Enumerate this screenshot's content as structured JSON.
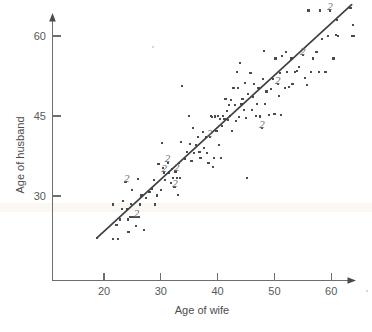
{
  "chart_data": {
    "type": "scatter",
    "title": "",
    "xlabel": "Age of wife",
    "ylabel": "Age of husband",
    "xlim": [
      14,
      66.5
    ],
    "ylim": [
      19.5,
      66.5
    ],
    "xticks": [
      20,
      30,
      40,
      50,
      60
    ],
    "yticks": [
      30,
      45,
      60
    ],
    "xtick_labels": [
      "20",
      "30",
      "40",
      "50",
      "60"
    ],
    "ytick_labels": [
      "30",
      "45",
      "60"
    ],
    "grid": false,
    "legend": null,
    "annotations": [
      {
        "text": "2",
        "x": 24.0,
        "y": 32.6
      },
      {
        "text": "2",
        "x": 25.7,
        "y": 26.0
      },
      {
        "text": "2",
        "x": 31.2,
        "y": 36.4
      },
      {
        "text": "2",
        "x": 30.6,
        "y": 34.5
      },
      {
        "text": "2",
        "x": 32.8,
        "y": 34.6
      },
      {
        "text": "2",
        "x": 32.5,
        "y": 31.6
      },
      {
        "text": "2",
        "x": 38.6,
        "y": 41.1
      },
      {
        "text": "2",
        "x": 47.8,
        "y": 42.7
      },
      {
        "text": "2",
        "x": 50.6,
        "y": 51.0
      },
      {
        "text": "2",
        "x": 55.0,
        "y": 56.5
      },
      {
        "text": "2",
        "x": 59.8,
        "y": 64.8
      }
    ],
    "fit_line": {
      "x": [
        18.8,
        63.6
      ],
      "y": [
        22.2,
        65.9
      ]
    },
    "points": [
      [
        18.8,
        22.2
      ],
      [
        21.6,
        22.0
      ],
      [
        22.4,
        22.0
      ],
      [
        21.6,
        28.4
      ],
      [
        22.2,
        24.5
      ],
      [
        22.8,
        25.6
      ],
      [
        23.2,
        27.5
      ],
      [
        23.4,
        29.0
      ],
      [
        23.8,
        32.6
      ],
      [
        24.0,
        27.5
      ],
      [
        24.2,
        25.6
      ],
      [
        24.3,
        23.2
      ],
      [
        24.6,
        26.0
      ],
      [
        24.8,
        28.5
      ],
      [
        24.9,
        31.2
      ],
      [
        25.0,
        26.0
      ],
      [
        25.4,
        26.1
      ],
      [
        25.6,
        24.4
      ],
      [
        25.8,
        26.1
      ],
      [
        26.0,
        33.2
      ],
      [
        26.2,
        26.1
      ],
      [
        26.4,
        28.4
      ],
      [
        26.6,
        30.1
      ],
      [
        27.0,
        23.6
      ],
      [
        27.4,
        29.6
      ],
      [
        28.0,
        30.8
      ],
      [
        28.4,
        31.4
      ],
      [
        28.8,
        33.0
      ],
      [
        29.0,
        28.4
      ],
      [
        29.4,
        30.1
      ],
      [
        29.6,
        36.0
      ],
      [
        30.0,
        31.1
      ],
      [
        30.2,
        40.0
      ],
      [
        30.4,
        35.2
      ],
      [
        30.6,
        34.4
      ],
      [
        30.8,
        33.0
      ],
      [
        31.2,
        36.2
      ],
      [
        31.5,
        34.4
      ],
      [
        31.8,
        32.4
      ],
      [
        32.0,
        35.1
      ],
      [
        32.2,
        33.4
      ],
      [
        32.4,
        31.7
      ],
      [
        32.6,
        34.6
      ],
      [
        32.8,
        33.4
      ],
      [
        33.0,
        30.2
      ],
      [
        33.2,
        36.2
      ],
      [
        33.4,
        33.4
      ],
      [
        33.6,
        40.2
      ],
      [
        33.8,
        50.6
      ],
      [
        34.2,
        37.0
      ],
      [
        34.6,
        38.2
      ],
      [
        35.0,
        45.0
      ],
      [
        35.2,
        39.8
      ],
      [
        35.4,
        36.6
      ],
      [
        35.6,
        42.8
      ],
      [
        35.8,
        38.0
      ],
      [
        36.2,
        39.6
      ],
      [
        36.6,
        41.0
      ],
      [
        36.8,
        38.2
      ],
      [
        37.0,
        37.2
      ],
      [
        37.4,
        42.0
      ],
      [
        37.6,
        39.0
      ],
      [
        38.0,
        41.0
      ],
      [
        38.2,
        38.0
      ],
      [
        38.4,
        36.2
      ],
      [
        38.6,
        41.1
      ],
      [
        38.8,
        45.0
      ],
      [
        39.0,
        44.8
      ],
      [
        39.2,
        35.4
      ],
      [
        39.4,
        37.2
      ],
      [
        39.6,
        44.9
      ],
      [
        39.8,
        42.2
      ],
      [
        40.0,
        45.0
      ],
      [
        40.2,
        39.6
      ],
      [
        40.4,
        44.4
      ],
      [
        40.6,
        37.2
      ],
      [
        40.8,
        43.1
      ],
      [
        41.0,
        45.0
      ],
      [
        41.2,
        44.4
      ],
      [
        41.4,
        48.2
      ],
      [
        41.6,
        46.0
      ],
      [
        41.8,
        44.2
      ],
      [
        42.0,
        47.0
      ],
      [
        42.2,
        45.0
      ],
      [
        42.4,
        48.0
      ],
      [
        42.6,
        42.2
      ],
      [
        42.8,
        50.2
      ],
      [
        43.0,
        47.0
      ],
      [
        43.2,
        44.0
      ],
      [
        43.4,
        53.2
      ],
      [
        43.6,
        50.2
      ],
      [
        43.8,
        44.8
      ],
      [
        44.0,
        55.0
      ],
      [
        44.2,
        47.2
      ],
      [
        44.4,
        48.2
      ],
      [
        44.6,
        46.2
      ],
      [
        44.8,
        51.2
      ],
      [
        45.0,
        44.6
      ],
      [
        45.2,
        33.4
      ],
      [
        45.4,
        49.2
      ],
      [
        45.8,
        53.0
      ],
      [
        46.0,
        46.2
      ],
      [
        46.2,
        48.6
      ],
      [
        46.4,
        51.0
      ],
      [
        46.8,
        45.0
      ],
      [
        47.0,
        47.2
      ],
      [
        47.2,
        50.2
      ],
      [
        47.4,
        44.9
      ],
      [
        47.8,
        42.7
      ],
      [
        48.0,
        52.0
      ],
      [
        48.2,
        57.2
      ],
      [
        48.4,
        47.2
      ],
      [
        48.6,
        49.6
      ],
      [
        49.0,
        45.2
      ],
      [
        49.4,
        50.0
      ],
      [
        49.8,
        52.0
      ],
      [
        50.0,
        45.4
      ],
      [
        50.2,
        55.8
      ],
      [
        50.6,
        51.0
      ],
      [
        50.8,
        48.8
      ],
      [
        51.0,
        53.0
      ],
      [
        51.2,
        45.2
      ],
      [
        51.4,
        56.2
      ],
      [
        51.8,
        50.2
      ],
      [
        52.0,
        57.0
      ],
      [
        52.2,
        53.2
      ],
      [
        52.6,
        50.4
      ],
      [
        53.0,
        55.8
      ],
      [
        53.2,
        51.0
      ],
      [
        53.6,
        53.2
      ],
      [
        54.0,
        53.4
      ],
      [
        54.4,
        54.2
      ],
      [
        55.0,
        56.5
      ],
      [
        55.4,
        52.2
      ],
      [
        55.8,
        50.8
      ],
      [
        56.0,
        64.8
      ],
      [
        56.4,
        53.2
      ],
      [
        56.8,
        55.8
      ],
      [
        57.4,
        57.0
      ],
      [
        57.8,
        53.2
      ],
      [
        58.0,
        64.8
      ],
      [
        58.4,
        59.4
      ],
      [
        59.0,
        53.2
      ],
      [
        59.4,
        60.0
      ],
      [
        59.8,
        64.8
      ],
      [
        60.4,
        55.8
      ],
      [
        60.8,
        60.2
      ],
      [
        61.0,
        63.0
      ],
      [
        61.2,
        60.0
      ],
      [
        63.4,
        65.2
      ],
      [
        63.6,
        60.0
      ],
      [
        63.8,
        62.0
      ],
      [
        64.0,
        60.0
      ]
    ]
  },
  "axes": {
    "x_title": "Age of wife",
    "y_title": "Age of husband",
    "x_tick_labels": [
      "20",
      "30",
      "40",
      "50",
      "60"
    ],
    "y_tick_labels": [
      "60",
      "45",
      "30"
    ]
  },
  "colors": {
    "point": "#4b4c4e",
    "line": "#3f4042",
    "axis": "#6d6e70",
    "text": "#58595b",
    "duplicate_label": "#6a6b6d",
    "background": "#ffffff"
  }
}
